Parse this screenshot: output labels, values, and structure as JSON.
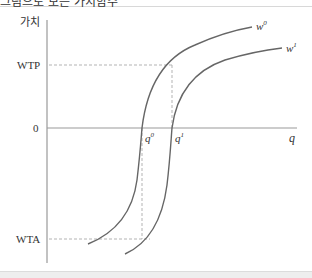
{
  "header": {
    "title_fragment": "그림으로 보는 가치함수"
  },
  "diagram": {
    "y_axis_label": "가치",
    "x_axis_label": "q",
    "origin_label": "0",
    "levels": {
      "wtp": "WTP",
      "wta": "WTA"
    },
    "quantities": {
      "q0_base": "q",
      "q0_sup": "0",
      "q1_base": "q",
      "q1_sup": "1"
    },
    "curves": [
      {
        "name_base": "w",
        "name_sup": "0"
      },
      {
        "name_base": "w",
        "name_sup": "1"
      }
    ],
    "colors": {
      "axis": "#999999",
      "curve": "#666666",
      "dash": "#aaaaaa"
    }
  }
}
